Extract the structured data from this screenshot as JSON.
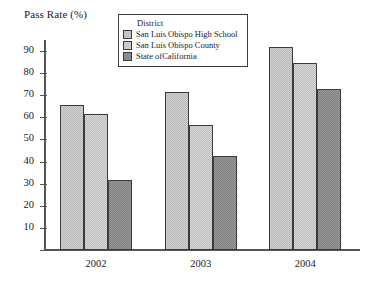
{
  "chart_data": {
    "type": "bar",
    "title": "Pass Rate (%)",
    "xlabel": "",
    "ylabel": "Pass Rate (%)",
    "ylim": [
      0,
      95
    ],
    "yticks": [
      0,
      10,
      20,
      30,
      40,
      50,
      60,
      70,
      80,
      90
    ],
    "grid": false,
    "legend_position": "top-center",
    "legend_title": "District",
    "categories": [
      "2002",
      "2003",
      "2004"
    ],
    "series": [
      {
        "name": "San Luis Obispo High School",
        "values": [
          65.5,
          71.5,
          92.0
        ],
        "color": "#d4d4d4"
      },
      {
        "name": "San Luis Obispo County",
        "values": [
          61.5,
          56.5,
          84.5
        ],
        "color": "#d9d9d9"
      },
      {
        "name": "State ofCalifornia",
        "values": [
          31.5,
          42.5,
          73.0
        ],
        "color": "#9a9a9a"
      }
    ]
  }
}
